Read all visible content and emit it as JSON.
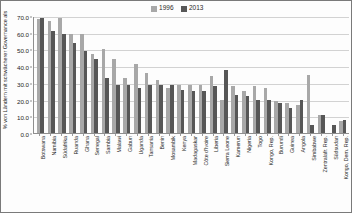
{
  "chart_data": {
    "type": "bar",
    "title": "",
    "xlabel": "",
    "ylabel": "% von Ländern mit schwächerer Governance als",
    "ylim": [
      0.0,
      70.0
    ],
    "ytick_labels": [
      "70.0",
      "60.0",
      "50.0",
      "40.0",
      "30.0",
      "20.0",
      "10.0",
      "0.0"
    ],
    "ytick_values": [
      70.0,
      60.0,
      50.0,
      40.0,
      30.0,
      20.0,
      10.0,
      0.0
    ],
    "grid": true,
    "legend_position": "top-center",
    "categories": [
      "Botswana",
      "Namibia",
      "Südafrika",
      "Ruanda",
      "Ghana",
      "Senegal",
      "Sambia",
      "Malawi",
      "Gabun",
      "Uganda",
      "Tansania",
      "Benin",
      "Mosambik",
      "Kenya",
      "Madagaskar",
      "Côte d'Ivoire",
      "Liberia",
      "Sierra Leone",
      "Kamerun",
      "Nigeria",
      "Togo",
      "Kongo, Rep.",
      "Burundi",
      "Guinea",
      "Angola",
      "Simbabwe",
      "Zentralafr. Rep.",
      "Südsudan",
      "Kongo, Dem. Rep."
    ],
    "series": [
      {
        "name": "1996",
        "color": "#a8a8a8",
        "values": [
          68.0,
          67.0,
          69.0,
          59.0,
          59.0,
          47.0,
          50.0,
          44.0,
          33.0,
          41.0,
          36.0,
          32.0,
          27.0,
          29.0,
          29.0,
          29.0,
          34.0,
          20.0,
          28.0,
          25.0,
          28.0,
          27.0,
          19.0,
          18.0,
          17.0,
          35.0,
          11.0,
          0.0,
          7.0
        ]
      },
      {
        "name": "2013",
        "color": "#575757",
        "values": [
          69.0,
          61.0,
          59.0,
          54.0,
          49.0,
          44.0,
          33.0,
          29.0,
          29.0,
          27.0,
          29.0,
          29.0,
          29.0,
          26.0,
          25.0,
          25.0,
          28.0,
          38.0,
          23.0,
          22.0,
          20.0,
          20.0,
          18.0,
          15.0,
          20.0,
          5.0,
          11.0,
          5.0,
          8.0
        ]
      }
    ]
  },
  "legend": {
    "items": [
      {
        "label": "1996",
        "color": "#a8a8a8"
      },
      {
        "label": "2013",
        "color": "#575757"
      }
    ]
  }
}
